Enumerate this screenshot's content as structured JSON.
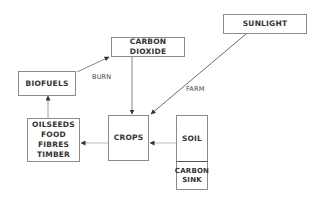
{
  "diagram": {
    "nodes": {
      "carbon_dioxide": "CARBON DIOXIDE",
      "sunlight": "SUNLIGHT",
      "biofuels": "BIOFUELS",
      "products": [
        "OILSEEDS",
        "FOOD",
        "FIBRES",
        "TIMBER"
      ],
      "crops": "CROPS",
      "soil": "SOIL",
      "carbon_sink": [
        "CARBON",
        "SINK"
      ]
    },
    "edge_labels": {
      "burn": "BURN",
      "farm": "FARM"
    },
    "edges": [
      {
        "from": "biofuels",
        "to": "carbon_dioxide",
        "label": "BURN"
      },
      {
        "from": "carbon_dioxide",
        "to": "crops"
      },
      {
        "from": "sunlight",
        "to": "crops",
        "label": "FARM"
      },
      {
        "from": "soil",
        "to": "crops"
      },
      {
        "from": "crops",
        "to": "products"
      },
      {
        "from": "products",
        "to": "biofuels"
      }
    ]
  }
}
